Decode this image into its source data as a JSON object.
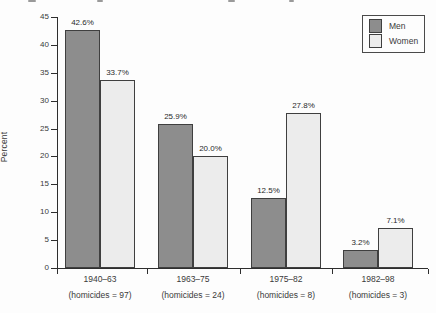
{
  "chart_data": {
    "type": "bar",
    "title": "",
    "xlabel": "",
    "ylabel": "Percent",
    "ylim": [
      0,
      45
    ],
    "ytick_interval": 5,
    "grid": false,
    "legend_position": "top-right",
    "categories": [
      "1940–63",
      "1963–75",
      "1975–82",
      "1982–98"
    ],
    "category_sublabels": [
      "(homicides = 97)",
      "(homicides = 24)",
      "(homicides = 8)",
      "(homicides = 3)"
    ],
    "series": [
      {
        "name": "Men",
        "values": [
          42.6,
          25.9,
          12.5,
          3.2
        ],
        "labels": [
          "42.6%",
          "25.9%",
          "12.5%",
          "3.2%"
        ],
        "color": "#8d8d8d"
      },
      {
        "name": "Women",
        "values": [
          33.7,
          20.0,
          27.8,
          7.1
        ],
        "labels": [
          "33.7%",
          "20.0%",
          "27.8%",
          "7.1%"
        ],
        "color": "#ececec"
      }
    ]
  },
  "colors": {
    "bar_border": "#3f3f3f",
    "axis": "#2e2e2e",
    "text": "#3a3a3a",
    "background": "#fdfdfd"
  }
}
